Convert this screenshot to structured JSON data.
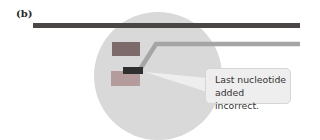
{
  "figure": {
    "panel_label": "(b)",
    "callout_text_line1": "Last nucleotide",
    "callout_text_line2": "added incorrect.",
    "colors": {
      "template_strand": "#4a4646",
      "new_strand": "#a5a5a5",
      "enzyme_circle": "#d9d9d9",
      "upper_block": "#7d6a6a",
      "incorrect_nucleotide": "#2f2f2f",
      "lower_block": "#b49c9c",
      "callout_bg": "#eeeeee"
    }
  }
}
